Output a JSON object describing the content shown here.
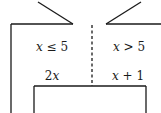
{
  "diagram": {
    "type": "piecewise-function-machine",
    "left_branch": {
      "condition": "x ≤ 5",
      "condition_var": "x",
      "condition_rest": " ≤ 5",
      "output": "2x",
      "output_coef": "2",
      "output_var": "x"
    },
    "right_branch": {
      "condition": "x > 5",
      "condition_var": "x",
      "condition_rest": " > 5",
      "output": "x + 1",
      "output_var": "x",
      "output_rest": " + 1"
    },
    "colors": {
      "stroke": "#1a1a1a",
      "background": "#ffffff"
    }
  }
}
